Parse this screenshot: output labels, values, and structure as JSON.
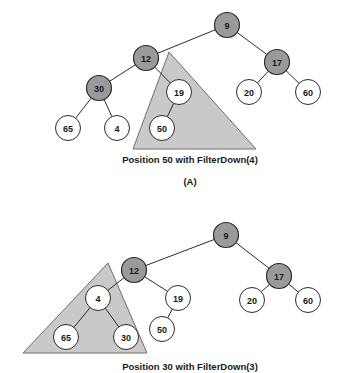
{
  "figure": {
    "type": "binary-heap-filterdown-illustration",
    "background_color": "#ffffff",
    "colors": {
      "shaded_node_fill": "#9a9a9a",
      "plain_node_fill": "#ffffff",
      "node_stroke": "#2b2b2b",
      "edge_stroke": "#2b2b2b",
      "triangle_fill": "#c9c9c9",
      "triangle_stroke": "#6e6e6e",
      "text_color": "#1a1a1a"
    },
    "node_radius": 12.5,
    "panels": [
      {
        "id": "panel-a",
        "caption": "Position 50 with FilterDown(4)",
        "label": "(A)",
        "highlight_triangle": {
          "apex": [
            169,
            52
          ],
          "base_left": [
            133,
            149
          ],
          "base_right": [
            256,
            149
          ]
        },
        "nodes": [
          {
            "id": "a-9",
            "label": "9",
            "x": 227,
            "y": 25,
            "shaded": true
          },
          {
            "id": "a-12",
            "label": "12",
            "x": 146,
            "y": 58,
            "shaded": true
          },
          {
            "id": "a-17",
            "label": "17",
            "x": 277,
            "y": 62,
            "shaded": true
          },
          {
            "id": "a-30",
            "label": "30",
            "x": 99,
            "y": 88,
            "shaded": true
          },
          {
            "id": "a-19",
            "label": "19",
            "x": 179,
            "y": 92,
            "shaded": false
          },
          {
            "id": "a-20",
            "label": "20",
            "x": 249,
            "y": 92,
            "shaded": false
          },
          {
            "id": "a-60",
            "label": "60",
            "x": 308,
            "y": 92,
            "shaded": false
          },
          {
            "id": "a-65",
            "label": "65",
            "x": 68,
            "y": 128,
            "shaded": false
          },
          {
            "id": "a-4",
            "label": "4",
            "x": 117,
            "y": 128,
            "shaded": false
          },
          {
            "id": "a-50",
            "label": "50",
            "x": 162,
            "y": 128,
            "shaded": false
          }
        ],
        "edges": [
          [
            "a-9",
            "a-12"
          ],
          [
            "a-9",
            "a-17"
          ],
          [
            "a-12",
            "a-30"
          ],
          [
            "a-12",
            "a-19"
          ],
          [
            "a-17",
            "a-20"
          ],
          [
            "a-17",
            "a-60"
          ],
          [
            "a-30",
            "a-65"
          ],
          [
            "a-30",
            "a-4"
          ],
          [
            "a-19",
            "a-50"
          ]
        ]
      },
      {
        "id": "panel-b",
        "caption": "Position 30 with FilterDown(3)",
        "label": "",
        "highlight_triangle": {
          "apex": [
            108,
            263
          ],
          "base_left": [
            23,
            353
          ],
          "base_right": [
            147,
            353
          ]
        },
        "nodes": [
          {
            "id": "b-9",
            "label": "9",
            "x": 226,
            "y": 235,
            "shaded": true
          },
          {
            "id": "b-12",
            "label": "12",
            "x": 134,
            "y": 270,
            "shaded": true
          },
          {
            "id": "b-17",
            "label": "17",
            "x": 279,
            "y": 276,
            "shaded": true
          },
          {
            "id": "b-4",
            "label": "4",
            "x": 98,
            "y": 298,
            "shaded": false
          },
          {
            "id": "b-19",
            "label": "19",
            "x": 178,
            "y": 298,
            "shaded": false
          },
          {
            "id": "b-20",
            "label": "20",
            "x": 252,
            "y": 300,
            "shaded": false
          },
          {
            "id": "b-60",
            "label": "60",
            "x": 308,
            "y": 300,
            "shaded": false
          },
          {
            "id": "b-65",
            "label": "65",
            "x": 66,
            "y": 337,
            "shaded": false
          },
          {
            "id": "b-30",
            "label": "30",
            "x": 126,
            "y": 337,
            "shaded": false
          },
          {
            "id": "b-50",
            "label": "50",
            "x": 162,
            "y": 329,
            "shaded": false
          }
        ],
        "edges": [
          [
            "b-9",
            "b-12"
          ],
          [
            "b-9",
            "b-17"
          ],
          [
            "b-12",
            "b-4"
          ],
          [
            "b-12",
            "b-19"
          ],
          [
            "b-17",
            "b-20"
          ],
          [
            "b-17",
            "b-60"
          ],
          [
            "b-4",
            "b-65"
          ],
          [
            "b-4",
            "b-30"
          ],
          [
            "b-19",
            "b-50"
          ]
        ]
      }
    ],
    "captions": {
      "panel_a_caption": "Position 50 with FilterDown(4)",
      "panel_a_caption_pos": [
        190,
        160
      ],
      "panel_a_label": "(A)",
      "panel_a_label_pos": [
        190,
        182
      ],
      "panel_b_caption": "Position 30 with FilterDown(3)",
      "panel_b_caption_pos": [
        190,
        367
      ]
    }
  }
}
